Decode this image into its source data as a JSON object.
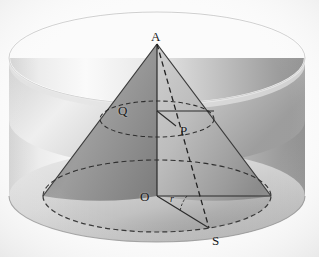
{
  "figure": {
    "background_color": "#fbfbfb",
    "width": 319,
    "height": 257
  },
  "labels": [
    {
      "id": "A",
      "text": "A",
      "role": "cone-apex",
      "x": 151,
      "y": 30,
      "size": "normal"
    },
    {
      "id": "Q",
      "text": "Q",
      "role": "axis-point-upper",
      "x": 118,
      "y": 108,
      "size": "normal"
    },
    {
      "id": "P",
      "text": "P",
      "role": "point-on-slant-line",
      "x": 180,
      "y": 128,
      "size": "normal"
    },
    {
      "id": "O",
      "text": "O",
      "role": "base-centre",
      "x": 140,
      "y": 192,
      "size": "normal"
    },
    {
      "id": "S",
      "text": "S",
      "role": "base-rim-point",
      "x": 212,
      "y": 236,
      "size": "normal"
    },
    {
      "id": "r",
      "text": "r",
      "role": "angle-or-radius-mark",
      "x": 170,
      "y": 192,
      "size": "small"
    }
  ],
  "geometry": {
    "cylinder": {
      "centre_x": 157,
      "top_ellipse": {
        "cx": 157,
        "cy": 58,
        "rx": 148,
        "ry": 46
      },
      "bottom_ellipse": {
        "cx": 157,
        "cy": 196,
        "rx": 148,
        "ry": 46
      },
      "side_height": 138,
      "fill_light": "#f2f2f2",
      "fill_mid": "#cfcfcf",
      "fill_dark": "#9a9a9a",
      "inner_wall_shade": "#c8c8c8"
    },
    "cone": {
      "apex": {
        "x": 157,
        "y": 44
      },
      "base_ellipse": {
        "cx": 157,
        "cy": 196,
        "rx": 114,
        "ry": 36
      },
      "left_face_fill": "#8f8f8f",
      "right_face_fill": "#b9b9b9",
      "outline_color": "#3a3a3a"
    },
    "cross_section_ellipse": {
      "cx": 157,
      "cy": 119,
      "rx": 57,
      "ry": 18,
      "style": "dashed"
    },
    "lines": [
      {
        "name": "axis-A-to-O",
        "from": "A",
        "to": "O",
        "style": "solid"
      },
      {
        "name": "slant-A-to-S",
        "from": "A",
        "to": "S",
        "style": "dashed"
      },
      {
        "name": "radius-Q-to-right",
        "from": "Q",
        "to": "cross-section-rim",
        "style": "solid"
      },
      {
        "name": "segment-Q-to-P",
        "from": "Q",
        "to": "P",
        "style": "solid"
      },
      {
        "name": "radius-O-to-right",
        "from": "O",
        "to": "base-rim-right",
        "style": "solid"
      },
      {
        "name": "segment-O-to-S",
        "from": "O",
        "to": "S",
        "style": "solid"
      }
    ]
  },
  "colors": {
    "ink": "#2b2b2b",
    "dash": "#333333",
    "paper": "#fbfbfb"
  }
}
